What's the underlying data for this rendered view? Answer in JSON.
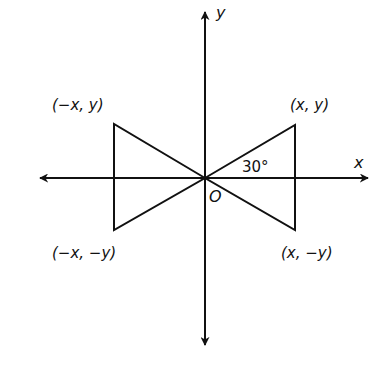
{
  "diagram": {
    "type": "coordinate-plane-bowtie",
    "colors": {
      "stroke": "#111111",
      "background": "#ffffff"
    },
    "axes": {
      "x_label": "x",
      "y_label": "y",
      "origin_label": "O"
    },
    "angle_label": "30°",
    "points": {
      "top_right": "(x, y)",
      "top_left": "(−x, y)",
      "bottom_left": "(−x, −y)",
      "bottom_right": "(x, −y)"
    }
  }
}
